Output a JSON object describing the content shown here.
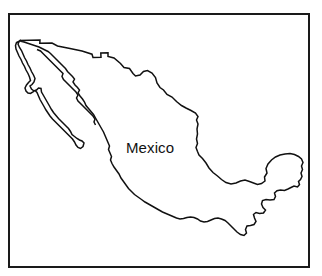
{
  "figure": {
    "kind": "line-art-map",
    "title": "Mexico",
    "background_color": "#ffffff"
  },
  "frame": {
    "name": "map-border-frame",
    "stroke_color": "#1a1a1a",
    "stroke_width": "2px"
  },
  "map": {
    "outline_color": "#111111",
    "fill_color": "#ffffff",
    "outline_width": "1.5",
    "regions": [
      {
        "name": "mainland",
        "label": "Mexico mainland"
      },
      {
        "name": "baja-california-peninsula",
        "label": "Baja California"
      }
    ]
  },
  "labels": [
    {
      "name": "country-label",
      "text": "Mexico",
      "color": "#111111",
      "font_size": "15px"
    }
  ]
}
